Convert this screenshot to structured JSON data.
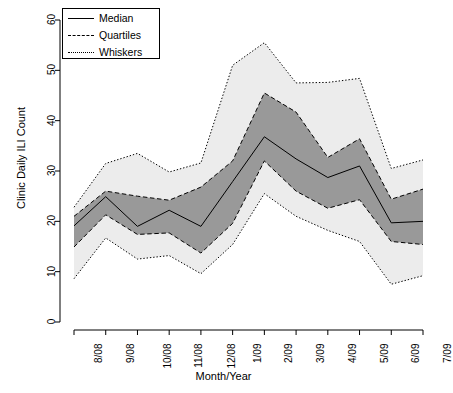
{
  "chart_data": {
    "type": "area",
    "title": "",
    "xlabel": "Month/Year",
    "ylabel": "Clinic Daily ILI Count",
    "categories": [
      "8/08",
      "9/08",
      "10/08",
      "11/08",
      "12/08",
      "1/09",
      "2/09",
      "3/09",
      "4/09",
      "5/09",
      "6/09",
      "7/09"
    ],
    "ylim": [
      0,
      62
    ],
    "yticks": [
      0,
      10,
      20,
      30,
      40,
      50,
      60
    ],
    "grid": false,
    "legend_position": "top-left",
    "series": [
      {
        "name": "Whiskers",
        "role": "upper-whisker",
        "style": "dotted",
        "values": [
          22.8,
          31.5,
          33.5,
          29.8,
          31.6,
          51.0,
          55.5,
          47.5,
          47.6,
          48.4,
          30.5,
          32.2
        ]
      },
      {
        "name": "Quartiles",
        "role": "upper-quartile",
        "style": "dashed",
        "values": [
          21.0,
          26.0,
          25.0,
          24.2,
          26.8,
          32.0,
          45.5,
          41.7,
          32.7,
          36.4,
          24.4,
          26.4
        ]
      },
      {
        "name": "Median",
        "role": "median",
        "style": "solid",
        "values": [
          19.1,
          24.9,
          19.0,
          22.2,
          19.0,
          27.9,
          36.8,
          32.4,
          28.7,
          31.0,
          19.7,
          20.0
        ]
      },
      {
        "name": "Quartiles",
        "role": "lower-quartile",
        "style": "dashed",
        "values": [
          14.9,
          21.3,
          17.4,
          17.7,
          13.7,
          19.6,
          32.0,
          26.0,
          22.6,
          24.3,
          16.0,
          15.4
        ]
      },
      {
        "name": "Whiskers",
        "role": "lower-whisker",
        "style": "dotted",
        "values": [
          8.6,
          16.7,
          12.5,
          13.2,
          9.6,
          15.4,
          25.5,
          21.0,
          18.2,
          16.0,
          7.5,
          9.2
        ]
      }
    ],
    "colors": {
      "iqr_band": "#999999",
      "whisker_band": "#ececec",
      "line": "#000000",
      "axis": "#000000",
      "background": "#ffffff"
    }
  },
  "legend": {
    "items": [
      {
        "label": "Median",
        "style": "solid"
      },
      {
        "label": "Quartiles",
        "style": "dashed"
      },
      {
        "label": "Whiskers",
        "style": "dotted"
      }
    ]
  }
}
